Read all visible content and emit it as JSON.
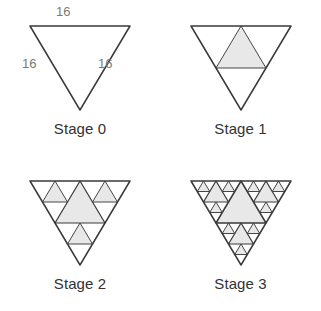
{
  "figure": {
    "background_color": "#ffffff",
    "stroke_color": "#3a3a3a",
    "fill_color": "#e8e8e8",
    "label_color": "#333333",
    "measure_color": "#7a7a7a",
    "orientation": "downward-pointing",
    "columns": 2,
    "rows": 2
  },
  "stages": [
    {
      "label": "Stage 0",
      "depth": 0,
      "shaded_count": 0,
      "side_labels": {
        "top": "16",
        "left": "16",
        "right": "16"
      }
    },
    {
      "label": "Stage 1",
      "depth": 1,
      "shaded_count": 1
    },
    {
      "label": "Stage 2",
      "depth": 2,
      "shaded_count": 4
    },
    {
      "label": "Stage 3",
      "depth": 3,
      "shaded_count": 13
    }
  ]
}
